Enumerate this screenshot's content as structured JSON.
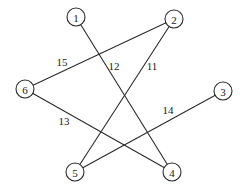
{
  "diagram": {
    "type": "weighted-graph",
    "colors": {
      "stroke": "#2a2a2a",
      "text": "#1a1a1a",
      "background": "#ffffff"
    },
    "node_radius": 9,
    "nodes": [
      {
        "id": "1",
        "label": "1",
        "x": 76,
        "y": 17
      },
      {
        "id": "2",
        "label": "2",
        "x": 174,
        "y": 19
      },
      {
        "id": "3",
        "label": "3",
        "x": 223,
        "y": 91
      },
      {
        "id": "4",
        "label": "4",
        "x": 172,
        "y": 172
      },
      {
        "id": "5",
        "label": "5",
        "x": 75,
        "y": 172
      },
      {
        "id": "6",
        "label": "6",
        "x": 25,
        "y": 89
      }
    ],
    "edges": [
      {
        "from": "1",
        "to": "4",
        "weight": "12",
        "label_x": 114,
        "label_y": 66
      },
      {
        "from": "2",
        "to": "6",
        "weight": "15",
        "label_x": 62,
        "label_y": 62
      },
      {
        "from": "2",
        "to": "5",
        "weight": "11",
        "label_x": 152,
        "label_y": 66
      },
      {
        "from": "6",
        "to": "4",
        "weight": "13",
        "label_x": 64,
        "label_y": 121
      },
      {
        "from": "3",
        "to": "5",
        "weight": "14",
        "label_x": 168,
        "label_y": 110
      }
    ]
  }
}
